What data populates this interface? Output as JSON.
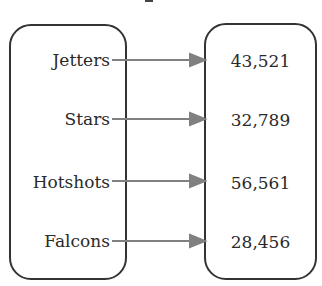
{
  "diagram": {
    "type": "mapping",
    "domain_label": "",
    "range_label": "",
    "arrow_color": "#808080",
    "pairs": [
      {
        "from": "Jetters",
        "to": "43,521"
      },
      {
        "from": "Stars",
        "to": "32,789"
      },
      {
        "from": "Hotshots",
        "to": "56,561"
      },
      {
        "from": "Falcons",
        "to": "28,456"
      }
    ]
  }
}
